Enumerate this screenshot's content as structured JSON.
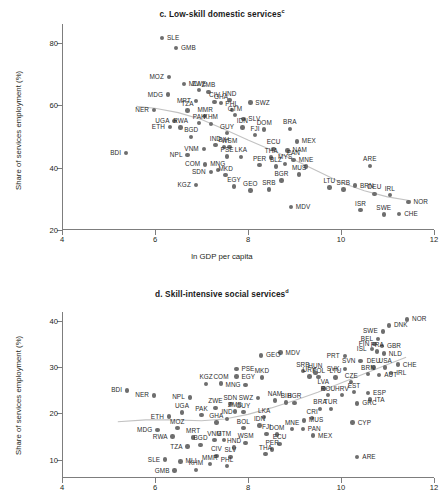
{
  "figure": {
    "xlabel": "ln GDP per capita",
    "ylabel": "Share of services employment (%)"
  },
  "panels": [
    {
      "id": "c",
      "title_prefix": "c. Low-skill domestic services",
      "title_sup": "c"
    },
    {
      "id": "d",
      "title_prefix": "d. Skill-intensive social services",
      "title_sup": "d"
    }
  ],
  "chart_data": [
    {
      "type": "scatter",
      "title": "c. Low-skill domestic services",
      "xlabel": "ln GDP per capita",
      "ylabel": "Share of services employment (%)",
      "xlim": [
        4,
        12
      ],
      "ylim": [
        20,
        86
      ],
      "xticks": [
        4,
        6,
        8,
        10,
        12
      ],
      "yticks": [
        20,
        40,
        60,
        80
      ],
      "grid": false,
      "legend": false,
      "point_label_key": "iso3",
      "trendline": "loess",
      "trend_points": [
        [
          5.6,
          59.6
        ],
        [
          6.0,
          59.0
        ],
        [
          6.5,
          57.6
        ],
        [
          7.0,
          55.4
        ],
        [
          7.5,
          52.2
        ],
        [
          8.0,
          48.8
        ],
        [
          8.5,
          45.6
        ],
        [
          9.0,
          42.4
        ],
        [
          9.5,
          38.8
        ],
        [
          10.0,
          35.2
        ],
        [
          10.5,
          32.6
        ],
        [
          11.0,
          30.6
        ],
        [
          11.5,
          29.4
        ]
      ],
      "points": [
        {
          "iso3": "SLE",
          "x": 6.15,
          "y": 81.6,
          "lp": "l"
        },
        {
          "iso3": "GMB",
          "x": 6.45,
          "y": 78.3,
          "lp": "l"
        },
        {
          "iso3": "MLI",
          "x": 6.62,
          "y": 66.8,
          "lp": "l"
        },
        {
          "iso3": "MOZ",
          "x": 6.3,
          "y": 69.0,
          "lp": "r"
        },
        {
          "iso3": "ZWE",
          "x": 6.95,
          "y": 64.8,
          "lp": "c"
        },
        {
          "iso3": "ZMB",
          "x": 7.15,
          "y": 64.3,
          "lp": "c"
        },
        {
          "iso3": "MDG",
          "x": 6.28,
          "y": 63.4,
          "lp": "r"
        },
        {
          "iso3": "MRT",
          "x": 6.88,
          "y": 61.3,
          "lp": "r"
        },
        {
          "iso3": "CIV",
          "x": 7.28,
          "y": 61.1,
          "lp": "c"
        },
        {
          "iso3": "GHA",
          "x": 7.42,
          "y": 60.6,
          "lp": "c"
        },
        {
          "iso3": "HND",
          "x": 7.6,
          "y": 61.6,
          "lp": "c"
        },
        {
          "iso3": "SWZ",
          "x": 8.05,
          "y": 60.8,
          "lp": "l"
        },
        {
          "iso3": "NER",
          "x": 5.98,
          "y": 58.5,
          "lp": "r"
        },
        {
          "iso3": "TZA",
          "x": 6.7,
          "y": 58.3,
          "lp": "c"
        },
        {
          "iso3": "PHL",
          "x": 7.65,
          "y": 58.4,
          "lp": "c"
        },
        {
          "iso3": "MMR",
          "x": 7.08,
          "y": 56.5,
          "lp": "c"
        },
        {
          "iso3": "GTM",
          "x": 7.72,
          "y": 56.8,
          "lp": "c"
        },
        {
          "iso3": "SLV",
          "x": 7.9,
          "y": 55.6,
          "lp": "l"
        },
        {
          "iso3": "UGA",
          "x": 6.42,
          "y": 55.0,
          "lp": "r"
        },
        {
          "iso3": "PAK",
          "x": 6.95,
          "y": 54.2,
          "lp": "c"
        },
        {
          "iso3": "KHM",
          "x": 7.2,
          "y": 54.0,
          "lp": "c"
        },
        {
          "iso3": "ETH",
          "x": 6.32,
          "y": 53.1,
          "lp": "r"
        },
        {
          "iso3": "RWA",
          "x": 6.55,
          "y": 52.9,
          "lp": "c"
        },
        {
          "iso3": "IDN",
          "x": 7.88,
          "y": 52.8,
          "lp": "c"
        },
        {
          "iso3": "DOM",
          "x": 8.35,
          "y": 52.2,
          "lp": "c"
        },
        {
          "iso3": "BRA",
          "x": 8.9,
          "y": 52.4,
          "lp": "c"
        },
        {
          "iso3": "GUY",
          "x": 7.55,
          "y": 51.0,
          "lp": "c"
        },
        {
          "iso3": "FJI",
          "x": 8.15,
          "y": 50.4,
          "lp": "c"
        },
        {
          "iso3": "BGD",
          "x": 6.78,
          "y": 49.8,
          "lp": "c"
        },
        {
          "iso3": "MEX",
          "x": 9.05,
          "y": 48.4,
          "lp": "l"
        },
        {
          "iso3": "IND",
          "x": 7.3,
          "y": 47.2,
          "lp": "c"
        },
        {
          "iso3": "BIH",
          "x": 7.48,
          "y": 46.6,
          "lp": "c"
        },
        {
          "iso3": "WSM",
          "x": 7.6,
          "y": 46.5,
          "lp": "c"
        },
        {
          "iso3": "VNM",
          "x": 7.05,
          "y": 46.0,
          "lp": "r"
        },
        {
          "iso3": "ECU",
          "x": 8.55,
          "y": 46.0,
          "lp": "c"
        },
        {
          "iso3": "NAM",
          "x": 8.85,
          "y": 45.5,
          "lp": "l"
        },
        {
          "iso3": "BDI",
          "x": 5.38,
          "y": 44.6,
          "lp": "r"
        },
        {
          "iso3": "NPL",
          "x": 6.7,
          "y": 44.0,
          "lp": "r"
        },
        {
          "iso3": "PSE",
          "x": 7.55,
          "y": 43.6,
          "lp": "c"
        },
        {
          "iso3": "LKA",
          "x": 7.85,
          "y": 43.4,
          "lp": "c"
        },
        {
          "iso3": "THA",
          "x": 8.5,
          "y": 43.2,
          "lp": "c"
        },
        {
          "iso3": "PAN",
          "x": 8.98,
          "y": 42.5,
          "lp": "c"
        },
        {
          "iso3": "ARE",
          "x": 10.62,
          "y": 40.6,
          "lp": "c"
        },
        {
          "iso3": "COM",
          "x": 7.08,
          "y": 41.0,
          "lp": "r"
        },
        {
          "iso3": "PER",
          "x": 8.25,
          "y": 40.8,
          "lp": "c"
        },
        {
          "iso3": "MYS",
          "x": 8.8,
          "y": 41.2,
          "lp": "c"
        },
        {
          "iso3": "BLZ",
          "x": 8.6,
          "y": 40.3,
          "lp": "c"
        },
        {
          "iso3": "MNE",
          "x": 9.25,
          "y": 40.4,
          "lp": "c"
        },
        {
          "iso3": "MNG",
          "x": 7.35,
          "y": 39.2,
          "lp": "c"
        },
        {
          "iso3": "SDN",
          "x": 7.2,
          "y": 38.6,
          "lp": "r"
        },
        {
          "iso3": "MKD",
          "x": 7.52,
          "y": 37.6,
          "lp": "c"
        },
        {
          "iso3": "MUS",
          "x": 9.1,
          "y": 37.8,
          "lp": "c"
        },
        {
          "iso3": "BGR",
          "x": 8.72,
          "y": 35.8,
          "lp": "c"
        },
        {
          "iso3": "KGZ",
          "x": 6.88,
          "y": 34.4,
          "lp": "r"
        },
        {
          "iso3": "EGY",
          "x": 7.7,
          "y": 34.0,
          "lp": "c"
        },
        {
          "iso3": "GEO",
          "x": 8.05,
          "y": 32.6,
          "lp": "c"
        },
        {
          "iso3": "SRB",
          "x": 8.45,
          "y": 33.0,
          "lp": "c"
        },
        {
          "iso3": "BRN",
          "x": 10.3,
          "y": 34.2,
          "lp": "l"
        },
        {
          "iso3": "LTU",
          "x": 9.75,
          "y": 33.6,
          "lp": "c"
        },
        {
          "iso3": "SRB2",
          "x": 10.05,
          "y": 33.0,
          "lp": "c"
        },
        {
          "iso3": "DEU",
          "x": 10.72,
          "y": 31.6,
          "lp": "c"
        },
        {
          "iso3": "IRL",
          "x": 11.05,
          "y": 31.2,
          "lp": "c"
        },
        {
          "iso3": "NOR",
          "x": 11.45,
          "y": 29.0,
          "lp": "l"
        },
        {
          "iso3": "MDV",
          "x": 8.92,
          "y": 27.4,
          "lp": "l"
        },
        {
          "iso3": "ISR",
          "x": 10.42,
          "y": 26.4,
          "lp": "c"
        },
        {
          "iso3": "SWE",
          "x": 10.92,
          "y": 25.0,
          "lp": "c"
        },
        {
          "iso3": "CHE",
          "x": 11.25,
          "y": 25.2,
          "lp": "l"
        }
      ]
    },
    {
      "type": "scatter",
      "title": "d. Skill-intensive social services",
      "xlabel": "ln GDP per capita",
      "ylabel": "Share of services employment (%)",
      "xlim": [
        4,
        12
      ],
      "ylim": [
        6,
        42
      ],
      "xticks": [
        4,
        6,
        8,
        10,
        12
      ],
      "yticks": [
        10,
        20,
        30,
        40
      ],
      "grid": false,
      "legend": false,
      "point_label_key": "iso3",
      "trendline": "loess",
      "trend_points": [
        [
          5.2,
          18.2
        ],
        [
          5.8,
          18.6
        ],
        [
          6.4,
          18.6
        ],
        [
          7.0,
          18.4
        ],
        [
          7.5,
          18.8
        ],
        [
          8.0,
          19.8
        ],
        [
          8.5,
          21.2
        ],
        [
          9.0,
          22.8
        ],
        [
          9.5,
          24.6
        ],
        [
          10.0,
          26.6
        ],
        [
          10.5,
          28.6
        ],
        [
          11.0,
          30.6
        ],
        [
          11.4,
          32.2
        ]
      ],
      "points": [
        {
          "iso3": "NOR",
          "x": 11.42,
          "y": 40.4,
          "lp": "l"
        },
        {
          "iso3": "DNK",
          "x": 11.03,
          "y": 39.1,
          "lp": "l"
        },
        {
          "iso3": "SWE",
          "x": 10.9,
          "y": 37.8,
          "lp": "r"
        },
        {
          "iso3": "BEL",
          "x": 10.8,
          "y": 36.2,
          "lp": "r"
        },
        {
          "iso3": "FIN",
          "x": 10.72,
          "y": 35.0,
          "lp": "r"
        },
        {
          "iso3": "GBR",
          "x": 10.88,
          "y": 34.6,
          "lp": "l"
        },
        {
          "iso3": "ISL",
          "x": 10.66,
          "y": 34.0,
          "lp": "r"
        },
        {
          "iso3": "FRA",
          "x": 10.78,
          "y": 33.4,
          "lp": "c"
        },
        {
          "iso3": "NLD",
          "x": 10.92,
          "y": 33.0,
          "lp": "l"
        },
        {
          "iso3": "PRT",
          "x": 10.08,
          "y": 32.4,
          "lp": "r"
        },
        {
          "iso3": "MDV",
          "x": 8.7,
          "y": 33.2,
          "lp": "l"
        },
        {
          "iso3": "GEO",
          "x": 8.28,
          "y": 32.6,
          "lp": "l"
        },
        {
          "iso3": "SVN",
          "x": 10.42,
          "y": 31.4,
          "lp": "r"
        },
        {
          "iso3": "CHE",
          "x": 11.22,
          "y": 30.6,
          "lp": "l"
        },
        {
          "iso3": "DEU",
          "x": 10.7,
          "y": 30.0,
          "lp": "c"
        },
        {
          "iso3": "USA",
          "x": 10.95,
          "y": 30.0,
          "lp": "c"
        },
        {
          "iso3": "PSE",
          "x": 7.75,
          "y": 29.6,
          "lp": "l"
        },
        {
          "iso3": "SVK",
          "x": 10.08,
          "y": 29.6,
          "lp": "r"
        },
        {
          "iso3": "SRB",
          "x": 9.18,
          "y": 29.2,
          "lp": "c"
        },
        {
          "iso3": "HUN",
          "x": 9.45,
          "y": 28.8,
          "lp": "c"
        },
        {
          "iso3": "IRL",
          "x": 11.08,
          "y": 28.8,
          "lp": "l"
        },
        {
          "iso3": "AUT",
          "x": 10.82,
          "y": 28.4,
          "lp": "l"
        },
        {
          "iso3": "BRN",
          "x": 10.58,
          "y": 28.5,
          "lp": "c"
        },
        {
          "iso3": "EGY",
          "x": 7.75,
          "y": 28.0,
          "lp": "l"
        },
        {
          "iso3": "MKD",
          "x": 8.3,
          "y": 27.8,
          "lp": "c"
        },
        {
          "iso3": "URY",
          "x": 9.32,
          "y": 28.0,
          "lp": "c"
        },
        {
          "iso3": "POL",
          "x": 9.52,
          "y": 27.9,
          "lp": "c"
        },
        {
          "iso3": "LTU",
          "x": 9.88,
          "y": 27.8,
          "lp": "c"
        },
        {
          "iso3": "KGZ",
          "x": 7.1,
          "y": 26.4,
          "lp": "c"
        },
        {
          "iso3": "COM",
          "x": 7.42,
          "y": 26.5,
          "lp": "c"
        },
        {
          "iso3": "CZE",
          "x": 10.22,
          "y": 26.8,
          "lp": "c"
        },
        {
          "iso3": "MNG",
          "x": 7.95,
          "y": 26.2,
          "lp": "r"
        },
        {
          "iso3": "BDI",
          "x": 5.4,
          "y": 25.0,
          "lp": "r"
        },
        {
          "iso3": "LVA",
          "x": 9.62,
          "y": 25.4,
          "lp": "c"
        },
        {
          "iso3": "ESP",
          "x": 10.58,
          "y": 24.4,
          "lp": "l"
        },
        {
          "iso3": "EST",
          "x": 10.28,
          "y": 24.6,
          "lp": "c"
        },
        {
          "iso3": "NER",
          "x": 5.98,
          "y": 23.9,
          "lp": "r"
        },
        {
          "iso3": "ROU",
          "x": 9.72,
          "y": 24.0,
          "lp": "c"
        },
        {
          "iso3": "HRV",
          "x": 10.02,
          "y": 24.0,
          "lp": "c"
        },
        {
          "iso3": "SWZ",
          "x": 8.22,
          "y": 23.4,
          "lp": "r"
        },
        {
          "iso3": "NAM",
          "x": 8.58,
          "y": 22.8,
          "lp": "c"
        },
        {
          "iso3": "ITA",
          "x": 10.62,
          "y": 23.0,
          "lp": "l"
        },
        {
          "iso3": "NPL",
          "x": 6.75,
          "y": 23.5,
          "lp": "r"
        },
        {
          "iso3": "BIH",
          "x": 8.82,
          "y": 22.4,
          "lp": "c"
        },
        {
          "iso3": "BGR",
          "x": 9.0,
          "y": 22.3,
          "lp": "c"
        },
        {
          "iso3": "SDN",
          "x": 7.62,
          "y": 22.0,
          "lp": "c"
        },
        {
          "iso3": "GRC",
          "x": 10.35,
          "y": 22.2,
          "lp": "l"
        },
        {
          "iso3": "ZWE",
          "x": 7.3,
          "y": 21.2,
          "lp": "c"
        },
        {
          "iso3": "BRA",
          "x": 9.55,
          "y": 21.0,
          "lp": "c"
        },
        {
          "iso3": "TUR",
          "x": 9.78,
          "y": 21.0,
          "lp": "c"
        },
        {
          "iso3": "ZMB",
          "x": 7.72,
          "y": 20.4,
          "lp": "c"
        },
        {
          "iso3": "GUY",
          "x": 7.9,
          "y": 20.3,
          "lp": "c"
        },
        {
          "iso3": "UGA",
          "x": 6.58,
          "y": 20.2,
          "lp": "c"
        },
        {
          "iso3": "PAK",
          "x": 7.0,
          "y": 19.6,
          "lp": "c"
        },
        {
          "iso3": "ETH",
          "x": 6.3,
          "y": 19.3,
          "lp": "r"
        },
        {
          "iso3": "LKA",
          "x": 8.35,
          "y": 19.2,
          "lp": "c"
        },
        {
          "iso3": "CRI",
          "x": 9.38,
          "y": 19.0,
          "lp": "c"
        },
        {
          "iso3": "IND",
          "x": 7.55,
          "y": 18.8,
          "lp": "c"
        },
        {
          "iso3": "MUS",
          "x": 9.2,
          "y": 18.5,
          "lp": "l"
        },
        {
          "iso3": "GHA",
          "x": 7.32,
          "y": 18.0,
          "lp": "c"
        },
        {
          "iso3": "CYP",
          "x": 10.25,
          "y": 18.0,
          "lp": "l"
        },
        {
          "iso3": "IDN",
          "x": 8.25,
          "y": 17.4,
          "lp": "c"
        },
        {
          "iso3": "PAN",
          "x": 9.18,
          "y": 16.6,
          "lp": "l"
        },
        {
          "iso3": "MNE",
          "x": 8.95,
          "y": 16.6,
          "lp": "c"
        },
        {
          "iso3": "MOZ",
          "x": 6.48,
          "y": 16.8,
          "lp": "c"
        },
        {
          "iso3": "BOL",
          "x": 7.9,
          "y": 16.8,
          "lp": "c"
        },
        {
          "iso3": "MDG",
          "x": 6.05,
          "y": 16.4,
          "lp": "r"
        },
        {
          "iso3": "FJI",
          "x": 8.4,
          "y": 15.6,
          "lp": "c"
        },
        {
          "iso3": "DOM",
          "x": 8.62,
          "y": 15.4,
          "lp": "c"
        },
        {
          "iso3": "MEX",
          "x": 9.4,
          "y": 15.2,
          "lp": "l"
        },
        {
          "iso3": "RWA",
          "x": 6.38,
          "y": 15.0,
          "lp": "r"
        },
        {
          "iso3": "MRT",
          "x": 6.82,
          "y": 14.8,
          "lp": "c"
        },
        {
          "iso3": "VNM",
          "x": 7.28,
          "y": 14.2,
          "lp": "c"
        },
        {
          "iso3": "GTM",
          "x": 7.48,
          "y": 14.2,
          "lp": "c"
        },
        {
          "iso3": "WSM",
          "x": 7.95,
          "y": 13.6,
          "lp": "c"
        },
        {
          "iso3": "ECU",
          "x": 8.68,
          "y": 13.4,
          "lp": "c"
        },
        {
          "iso3": "BGD",
          "x": 6.98,
          "y": 13.2,
          "lp": "c"
        },
        {
          "iso3": "TZA",
          "x": 6.7,
          "y": 12.8,
          "lp": "r"
        },
        {
          "iso3": "HND",
          "x": 7.7,
          "y": 12.6,
          "lp": "c"
        },
        {
          "iso3": "PER",
          "x": 8.52,
          "y": 12.2,
          "lp": "c"
        },
        {
          "iso3": "THA",
          "x": 8.38,
          "y": 11.2,
          "lp": "c"
        },
        {
          "iso3": "CIV",
          "x": 7.32,
          "y": 10.8,
          "lp": "c"
        },
        {
          "iso3": "SLV",
          "x": 7.62,
          "y": 10.6,
          "lp": "c"
        },
        {
          "iso3": "ARE",
          "x": 10.35,
          "y": 10.6,
          "lp": "l"
        },
        {
          "iso3": "SLE",
          "x": 6.22,
          "y": 10.0,
          "lp": "r"
        },
        {
          "iso3": "MLI",
          "x": 6.55,
          "y": 9.6,
          "lp": "l"
        },
        {
          "iso3": "MMR",
          "x": 7.18,
          "y": 9.0,
          "lp": "c"
        },
        {
          "iso3": "PHL",
          "x": 7.55,
          "y": 8.6,
          "lp": "c"
        },
        {
          "iso3": "KHM",
          "x": 6.88,
          "y": 7.8,
          "lp": "c"
        },
        {
          "iso3": "GMB",
          "x": 6.42,
          "y": 7.6,
          "lp": "r"
        }
      ]
    }
  ]
}
